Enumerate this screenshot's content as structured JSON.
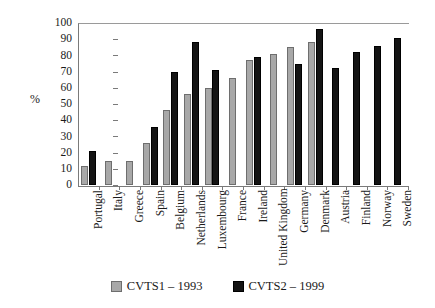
{
  "chart_data": {
    "type": "bar",
    "title": "",
    "subtitle": "",
    "xlabel": "",
    "ylabel": "%",
    "ylim": [
      0,
      100
    ],
    "yticks": [
      0,
      10,
      20,
      30,
      40,
      50,
      60,
      70,
      80,
      90,
      100
    ],
    "ytick_labels": [
      "0",
      "10",
      "20",
      "30",
      "40",
      "50",
      "60",
      "70",
      "80",
      "90",
      "100"
    ],
    "grid": false,
    "legend_position": "bottom-center",
    "categories": [
      "Portugal",
      "Italy",
      "Greece",
      "Spain",
      "Belgium",
      "Netherlands",
      "Luxembourg",
      "France",
      "Ireland",
      "United Kingdom",
      "Germany",
      "Denmark",
      "Austria",
      "Finland",
      "Norway",
      "Sweden"
    ],
    "series": [
      {
        "name": "CVTS1 – 1993",
        "color": "#a8a8a8",
        "values": [
          12,
          15,
          15,
          26,
          46,
          56,
          60,
          66,
          77,
          81,
          85,
          88,
          null,
          null,
          null,
          null
        ]
      },
      {
        "name": "CVTS2 – 1999",
        "color": "#141414",
        "values": [
          21,
          null,
          null,
          36,
          70,
          88,
          71,
          null,
          79,
          null,
          75,
          96,
          72,
          82,
          86,
          91
        ]
      }
    ]
  },
  "legend": {
    "entries": [
      {
        "label": "CVTS1 – 1993",
        "swatch": "series1-swatch"
      },
      {
        "label": "CVTS2 – 1999",
        "swatch": "series2-swatch"
      }
    ]
  }
}
